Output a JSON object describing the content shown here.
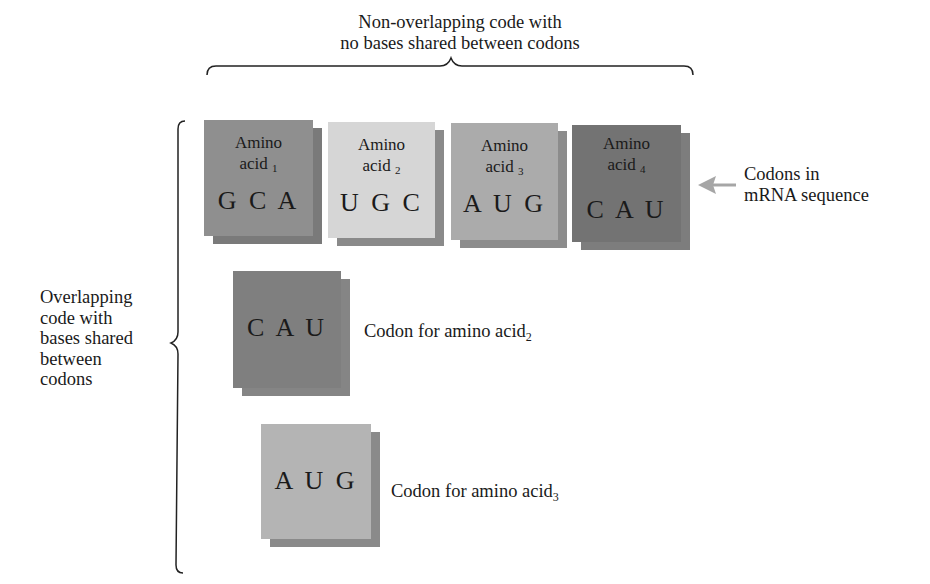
{
  "top_label": {
    "line1": "Non-overlapping code with",
    "line2": "no bases shared between codons"
  },
  "left_label": {
    "lines": [
      "Overlapping",
      "code with",
      "bases shared",
      "between",
      "codons"
    ]
  },
  "arrow_label": {
    "line1": "Codons in",
    "line2": "mRNA sequence"
  },
  "codons_row": [
    {
      "word": "Amino",
      "acid": "acid",
      "index": "1",
      "codon": "G C A",
      "color": "#8f8f8f",
      "shadow": "#7a7a7a"
    },
    {
      "word": "Amino",
      "acid": "acid",
      "index": "2",
      "codon": "U G C",
      "color": "#d6d6d6",
      "shadow": "#8a8a8a"
    },
    {
      "word": "Amino",
      "acid": "acid",
      "index": "3",
      "codon": "A U G",
      "color": "#ababab",
      "shadow": "#8c8c8c"
    },
    {
      "word": "Amino",
      "acid": "acid",
      "index": "4",
      "codon": "C A U",
      "color": "#737373",
      "shadow": "#7d7d7d"
    }
  ],
  "overlap": [
    {
      "codon": "C A U",
      "desc": "Codon for amino acid",
      "index": "2",
      "color": "#7f7f7f",
      "shadow": "#858585"
    },
    {
      "codon": "A U G",
      "desc": "Codon for amino acid",
      "index": "3",
      "color": "#b4b4b4",
      "shadow": "#8a8a8a"
    }
  ],
  "colors": {
    "bracket": "#222222",
    "arrow": "#a6a6a6",
    "text": "#1a1a1a"
  }
}
